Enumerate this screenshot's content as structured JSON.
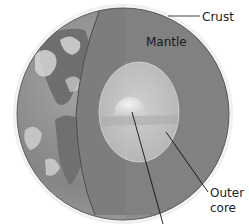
{
  "diagram": {
    "labels": {
      "crust": "Crust",
      "mantle": "Mantle",
      "outer_core_line1": "Outer",
      "outer_core_line2": "core"
    },
    "layers": [
      "Crust",
      "Mantle",
      "Outer core",
      "Inner core"
    ],
    "colors": {
      "background": "#ffffff",
      "mantle": "#7d7d7d",
      "mantle_edge": "#5a5a5a",
      "outer_core": "#c4c4c4",
      "inner_core": "#e6e6e6",
      "globe_ocean": "#8a8a8a",
      "globe_land": "#6e6e6e",
      "clouds": "#d8d8d8",
      "leader_lines": "#111111"
    }
  }
}
